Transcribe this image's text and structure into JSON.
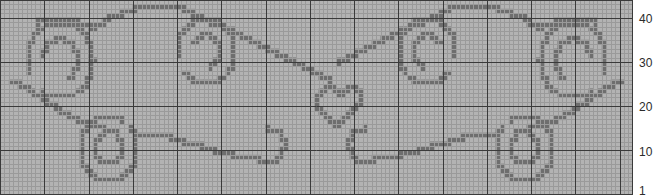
{
  "chart_data": {
    "type": "heatmap",
    "title": "",
    "subtitle": "",
    "xlabel": "",
    "ylabel": "",
    "legend": [],
    "annotations": [],
    "grid": true,
    "grid_minor_color": "#9a9a9a",
    "grid_major_color": "#3a3a3a",
    "grid_major_every": 10,
    "background_color": "#b3b3b3",
    "stitch_color": "#6e6e6e",
    "page_background": "#ffffff",
    "columns": 143,
    "rows": 44,
    "cell_size": 4.425,
    "x": [],
    "xtick_labels": [],
    "ytick_labels": [
      "40",
      "30",
      "20",
      "10",
      "1"
    ],
    "ytick_rows": [
      40,
      30,
      20,
      10,
      1
    ],
    "ylim": [
      1,
      44
    ],
    "motifs": [
      {
        "name": "left-upper-swirl",
        "center_col": 13,
        "center_row": 31
      },
      {
        "name": "left-inner-swirl",
        "center_col": 46,
        "center_row": 33
      },
      {
        "name": "left-lower-swirl",
        "center_col": 24,
        "center_row": 11
      },
      {
        "name": "center-heart",
        "center_col": 76,
        "center_row": 21
      },
      {
        "name": "right-inner-swirl",
        "center_col": 106,
        "center_row": 33
      },
      {
        "name": "right-upper-swirl",
        "center_col": 139,
        "center_row": 31
      },
      {
        "name": "right-lower-swirl",
        "center_col": 128,
        "center_row": 11
      }
    ],
    "filled_cells_rle": "generated-by-motif-paths"
  }
}
